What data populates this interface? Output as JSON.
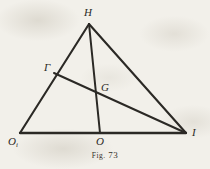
{
  "figure": {
    "caption_prefix": "Fig.",
    "caption_number": "73",
    "caption_full": "FIG. 73",
    "background_color": "#f2f0ea",
    "ink_color": "#2b2925"
  },
  "labels": {
    "apex": "H",
    "left_side_point": "Γ",
    "intersection": "G",
    "right_vertex": "I",
    "left_vertex": "O",
    "left_vertex_subscript": "i",
    "base_point": "O"
  },
  "chart_data": {
    "type": "diagram",
    "title": "FIG. 73",
    "points": [
      {
        "name": "H",
        "label": "H",
        "x": 89,
        "y": 24
      },
      {
        "name": "O1",
        "label": "Oi",
        "x": 20,
        "y": 133
      },
      {
        "name": "I",
        "label": "I",
        "x": 186,
        "y": 133
      },
      {
        "name": "O",
        "label": "O",
        "x": 100,
        "y": 133
      },
      {
        "name": "Gamma",
        "label": "Γ",
        "x": 54,
        "y": 73
      },
      {
        "name": "G",
        "label": "G",
        "x": 100,
        "y": 96
      }
    ],
    "segments": [
      {
        "name": "side-H-O1",
        "from": "H",
        "to": "O1"
      },
      {
        "name": "side-H-I",
        "from": "H",
        "to": "I"
      },
      {
        "name": "base-O1-I",
        "from": "O1",
        "to": "I"
      },
      {
        "name": "cevian-H-O",
        "from": "H",
        "to": "O"
      },
      {
        "name": "cevian-Gamma-I",
        "from": "Gamma",
        "to": "I"
      }
    ],
    "xlabel": "",
    "ylabel": "",
    "grid": false
  }
}
